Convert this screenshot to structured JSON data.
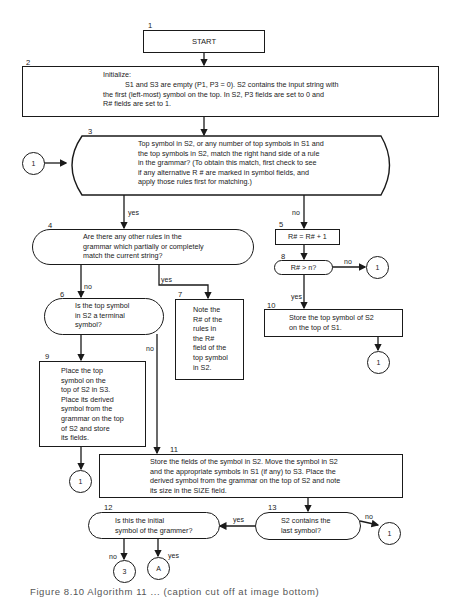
{
  "flowchart": {
    "nodes": {
      "n1": {
        "number": "1",
        "shape": "rectangle",
        "text": "START"
      },
      "n2": {
        "number": "2",
        "shape": "rectangle",
        "title": "Initialize:",
        "text": "S1 and S3 are empty (P1, P3 = 0). S2 contains the input string with\nthe first (left-most) symbol on the top.  In S2, P3 fields are set to 0 and\nR# fields are set to 1."
      },
      "n3": {
        "number": "3",
        "shape": "decision",
        "text": "Top symbol in S2, or any number of top symbols in S1 and\nthe top symbols in S2, match the right hand side of a rule\nin the grammar? (To obtain this match, first check to see\nif any alternative R # are marked in symbol fields, and\napply those rules first for matching.)"
      },
      "n4": {
        "number": "4",
        "shape": "decision",
        "text": "Are there any other rules in the\ngrammar which partially or completely\nmatch the current string?"
      },
      "n5": {
        "number": "5",
        "shape": "rectangle",
        "text": "R# = R# + 1"
      },
      "n6": {
        "number": "6",
        "shape": "decision",
        "text": "Is the top symbol\nin S2 a terminal\nsymbol?"
      },
      "n7": {
        "number": "7",
        "shape": "rectangle",
        "text": "Note the\nR# of the\nrules in\nthe R#\nfield of the\ntop symbol\nin S2."
      },
      "n8": {
        "number": "8",
        "shape": "decision",
        "text": "R# > n?"
      },
      "n9": {
        "number": "9",
        "shape": "rectangle",
        "text": "Place the top\nsymbol on the\ntop of S2 in S3.\nPlace its derived\nsymbol from the\ngrammar on the top\nof S2 and store\nits fields."
      },
      "n10": {
        "number": "10",
        "shape": "rectangle",
        "text": "Store the top symbol of S2\non the top of S1."
      },
      "n11": {
        "number": "11",
        "shape": "rectangle",
        "text": "Store the fields of the symbol in S2.  Move the symbol in S2\nand the appropriate symbols in S1 (if any) to S3.  Place the\nderived symbol from the grammar on the top of S2 and note\nits size in the SIZE field."
      },
      "n12": {
        "number": "12",
        "shape": "decision",
        "text": "Is this the initial\nsymbol of the grammer?"
      },
      "n13": {
        "number": "13",
        "shape": "decision",
        "text": "S2 contains the\nlast symbol?"
      }
    },
    "connectors": {
      "c_left_3": "1",
      "c_8_no": "1",
      "c_10": "1",
      "c_9": "1",
      "c_13_no": "1",
      "c_12_no": "3",
      "c_12_yes": "A"
    },
    "edge_labels": {
      "e3_yes": "yes",
      "e3_no": "no",
      "e4_no": "no",
      "e4_yes": "yes",
      "e6_no": "no",
      "e8_no": "no",
      "e8_yes": "yes",
      "e13_yes": "yes",
      "e13_no": "no",
      "e12_no": "no",
      "e12_yes": "yes"
    }
  },
  "caption": "Figure 8.10  Algorithm 11  ...  (caption cut off at image bottom)"
}
